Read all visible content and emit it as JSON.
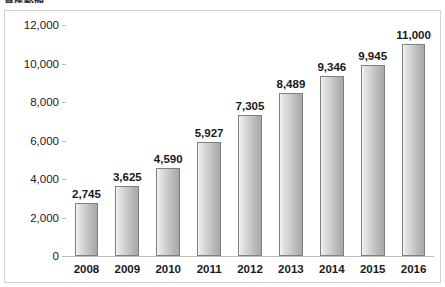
{
  "chart_data": {
    "type": "bar",
    "title": "資産総額",
    "xlabel": "",
    "ylabel": "",
    "categories": [
      "2008",
      "2009",
      "2010",
      "2011",
      "2012",
      "2013",
      "2014",
      "2015",
      "2016"
    ],
    "values": [
      2745,
      3625,
      4590,
      5927,
      7305,
      8489,
      9346,
      9945,
      11000
    ],
    "value_labels": [
      "2,745",
      "3,625",
      "4,590",
      "5,927",
      "7,305",
      "8,489",
      "9,346",
      "9,945",
      "11,000"
    ],
    "ylim": [
      0,
      12000
    ],
    "ytick_step": 2000,
    "ytick_labels": [
      "12,000",
      "10,000",
      "8,000",
      "6,000",
      "4,000",
      "2,000",
      "0"
    ],
    "ytick_values": [
      12000,
      10000,
      8000,
      6000,
      4000,
      2000,
      0
    ],
    "grid": false,
    "legend": false,
    "series": [
      {
        "name": "資産総額",
        "values": [
          2745,
          3625,
          4590,
          5927,
          7305,
          8489,
          9346,
          9945,
          11000
        ]
      }
    ],
    "colors": {
      "bar_fill_light": "#f4f4f4",
      "bar_fill_dark": "#a8a8a8",
      "bar_border": "#808080",
      "axis_line": "#bdbdbd",
      "frame_border": "#d4d4d4",
      "plot_background": "#ffffff",
      "text": "#1a1a1a"
    }
  }
}
